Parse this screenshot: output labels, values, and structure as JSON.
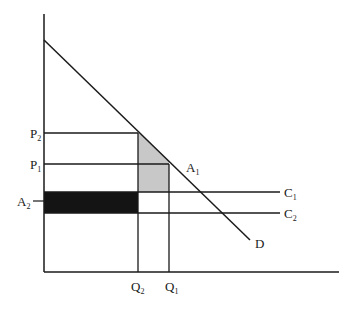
{
  "diagram": {
    "type": "economics-supply-demand",
    "colors": {
      "line": "#1a1a1a",
      "shaded_gray": "#c8c8c8",
      "shaded_black": "#141414",
      "background": "#ffffff"
    },
    "axes": {
      "y_axis": {
        "x": 44,
        "y_top": 14,
        "y_bottom": 272
      },
      "x_axis": {
        "y": 272,
        "x_left": 44,
        "x_right": 339
      }
    },
    "demand": {
      "label": "D",
      "x1": 44,
      "y1": 40,
      "x2": 250,
      "y2": 240
    },
    "cost_lines": [
      {
        "label": "C",
        "sub": "1",
        "y": 192,
        "x_end": 280
      },
      {
        "label": "C",
        "sub": "2",
        "y": 213,
        "x_end": 280
      }
    ],
    "price_levels": [
      {
        "label": "P",
        "sub": "2",
        "y": 133,
        "x_end": 138
      },
      {
        "label": "P",
        "sub": "1",
        "y": 164,
        "x_end": 169
      }
    ],
    "quantities": [
      {
        "label": "Q",
        "sub": "2",
        "x": 138,
        "y_top": 133
      },
      {
        "label": "Q",
        "sub": "1",
        "x": 169,
        "y_top": 164
      }
    ],
    "points": [
      {
        "label": "A",
        "sub": "1",
        "x": 186,
        "y": 172
      },
      {
        "label": "A",
        "sub": "2",
        "x": 17,
        "y": 206
      }
    ],
    "areas": [
      {
        "name": "gray-area",
        "description": "area between Q2 and Q1 under demand, above C1"
      },
      {
        "name": "black-area",
        "description": "rectangle from axis to Q2 between C1 and C2"
      }
    ]
  }
}
